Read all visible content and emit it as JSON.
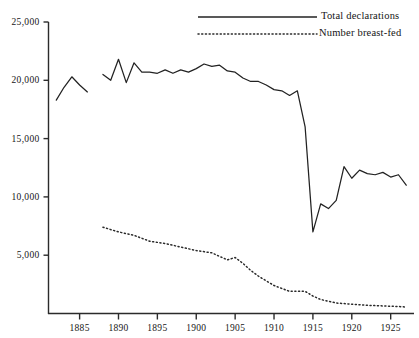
{
  "chart_data": {
    "type": "line",
    "title": "",
    "subtitle": "",
    "xlabel": "",
    "ylabel": "",
    "xlim": [
      1881,
      1928
    ],
    "ylim": [
      0,
      25000
    ],
    "grid": false,
    "legend_position": "top-right",
    "y_ticks": [
      5000,
      10000,
      15000,
      20000,
      25000
    ],
    "y_tick_labels": [
      "5,000",
      "10,000",
      "15,000",
      "20,000",
      "25,000"
    ],
    "x_ticks": [
      1885,
      1890,
      1895,
      1900,
      1905,
      1910,
      1915,
      1920,
      1925
    ],
    "x_tick_labels": [
      "1885",
      "1890",
      "1895",
      "1900",
      "1905",
      "1910",
      "1915",
      "1920",
      "1925"
    ],
    "series": [
      {
        "name": "Total declarations",
        "style": "solid",
        "color": "#222222",
        "segments": [
          {
            "x": [
              1882,
              1883,
              1884,
              1885,
              1886
            ],
            "values": [
              18300,
              19400,
              20300,
              19600,
              19000
            ]
          },
          {
            "x": [
              1888,
              1889,
              1890,
              1891,
              1892,
              1893,
              1894,
              1895,
              1896,
              1897,
              1898,
              1899,
              1900,
              1901,
              1902,
              1903,
              1904,
              1905,
              1906,
              1907,
              1908,
              1909,
              1910,
              1911,
              1912,
              1913,
              1914,
              1915,
              1916,
              1917,
              1918,
              1919,
              1920,
              1921,
              1922,
              1923,
              1924,
              1925,
              1926,
              1927
            ],
            "values": [
              20500,
              20000,
              21800,
              19800,
              21500,
              20700,
              20700,
              20600,
              20900,
              20600,
              20900,
              20700,
              21000,
              21400,
              21200,
              21300,
              20800,
              20700,
              20200,
              19900,
              19900,
              19600,
              19200,
              19100,
              18700,
              19100,
              16000,
              7000,
              9400,
              9000,
              9700,
              12600,
              11600,
              12300,
              12000,
              11900,
              12100,
              11700,
              11900,
              11000
            ]
          }
        ]
      },
      {
        "name": "Number breast-fed",
        "style": "dotted",
        "color": "#2a2a2a",
        "segments": [
          {
            "x": [
              1888,
              1890,
              1892,
              1894,
              1896,
              1898,
              1900,
              1902,
              1904,
              1905,
              1906,
              1907,
              1908,
              1910,
              1912,
              1914,
              1915,
              1916,
              1918,
              1920,
              1922,
              1924,
              1926,
              1927
            ],
            "values": [
              7400,
              7000,
              6700,
              6200,
              6000,
              5700,
              5400,
              5200,
              4600,
              4800,
              4300,
              3700,
              3200,
              2400,
              1900,
              1900,
              1500,
              1200,
              900,
              800,
              700,
              650,
              600,
              550
            ]
          }
        ]
      }
    ]
  },
  "legend": {
    "entries": [
      {
        "label": "Total declarations",
        "style": "solid"
      },
      {
        "label": "Number breast-fed",
        "style": "dotted"
      }
    ]
  }
}
